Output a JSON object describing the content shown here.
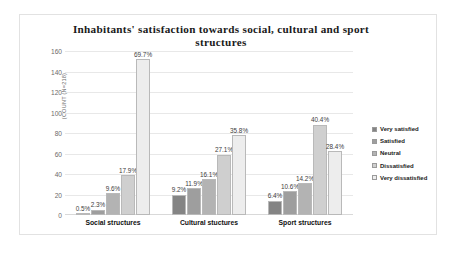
{
  "chart_data": {
    "type": "bar",
    "title": "Inhabitants' satisfaction towards social, cultural and sport structures",
    "xlabel": "",
    "ylabel": "(COUNT (N=218)",
    "ylim": [
      0,
      160
    ],
    "ytick_step": 20,
    "yticks": [
      "160",
      "140",
      "120",
      "100",
      "80",
      "60",
      "40",
      "20",
      "0"
    ],
    "grid": true,
    "legend_position": "right",
    "sample_size": 218,
    "categories": [
      "Social structures",
      "Cultural stuctures",
      "Sport structures"
    ],
    "series": [
      {
        "name": "Very satisfied",
        "color": "#848484",
        "values": [
          1,
          20,
          14
        ],
        "labels": [
          "0.5%",
          "9.2%",
          "6.4%"
        ]
      },
      {
        "name": "Satisfied",
        "color": "#9e9e9e",
        "values": [
          5,
          26,
          23
        ],
        "labels": [
          "2.3%",
          "11.9%",
          "10.6%"
        ]
      },
      {
        "name": "Neutral",
        "color": "#b3b3b3",
        "values": [
          21,
          35,
          31
        ],
        "labels": [
          "9.6%",
          "16.1%",
          "14.2%"
        ]
      },
      {
        "name": "Dissatisfied",
        "color": "#cfcfcf",
        "values": [
          39,
          59,
          88
        ],
        "labels": [
          "17.9%",
          "27.1%",
          "40.4%"
        ]
      },
      {
        "name": "Very dissatisfied",
        "color": "#ededed",
        "values": [
          152,
          78,
          62
        ],
        "labels": [
          "69.7%",
          "35.8%",
          "28.4%"
        ]
      }
    ]
  }
}
